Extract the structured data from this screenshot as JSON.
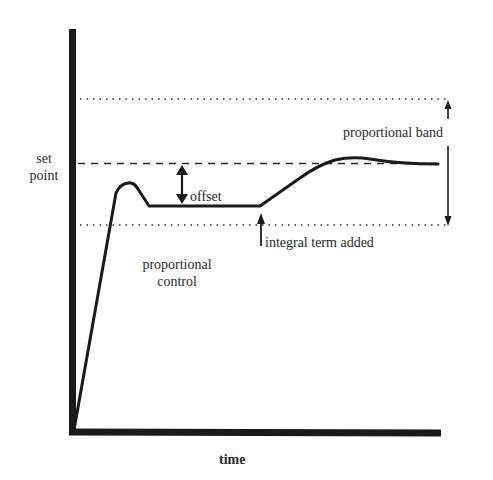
{
  "diagram": {
    "type": "control-response-diagram",
    "axes": {
      "x_label": "time",
      "y_label_line1": "set",
      "y_label_line2": "point"
    },
    "labels": {
      "offset": "offset",
      "proportional_band": "proportional band",
      "integral_term_added": "integral term added",
      "proportional_control_line1": "proportional",
      "proportional_control_line2": "control"
    },
    "lines": {
      "set_point": "dashed",
      "band_upper": "dotted",
      "band_lower": "dotted"
    },
    "colors": {
      "stroke": "#1a1a1a",
      "text": "#2a2a2a",
      "background": "#ffffff"
    }
  }
}
